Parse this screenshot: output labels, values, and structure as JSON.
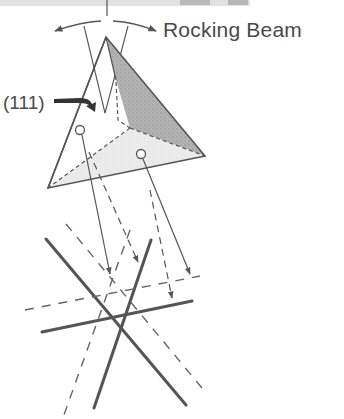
{
  "labels": {
    "rocking_beam": "Rocking Beam",
    "plane": "(111)"
  },
  "colors": {
    "line": "#555555",
    "text": "#4a4a4a",
    "dark_face": "#a9a9a9",
    "light_face": "#e6e6e6",
    "texture": "#9a9a9a"
  }
}
